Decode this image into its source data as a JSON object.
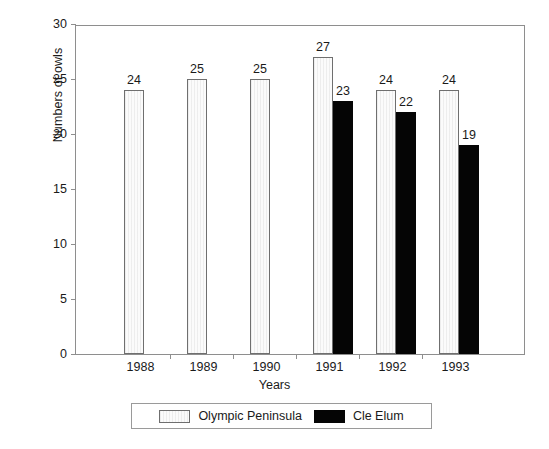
{
  "chart_data": {
    "type": "bar",
    "title": "",
    "xlabel": "Years",
    "ylabel": "Numbers of owls",
    "categories": [
      "1988",
      "1989",
      "1990",
      "1991",
      "1992",
      "1993"
    ],
    "series": [
      {
        "name": "Olympic Peninsula",
        "color": "#fbfbfb",
        "values": [
          24,
          25,
          25,
          27,
          24,
          24
        ]
      },
      {
        "name": "Cle Elum",
        "color": "#050505",
        "values": [
          null,
          null,
          null,
          23,
          22,
          19
        ]
      }
    ],
    "ylim": [
      0,
      30
    ],
    "yticks": [
      0,
      5,
      10,
      15,
      20,
      25,
      30
    ],
    "grid": false,
    "legend_position": "bottom",
    "bar_labels": [
      {
        "category": "1988",
        "series": "Olympic Peninsula",
        "label": "24"
      },
      {
        "category": "1989",
        "series": "Olympic Peninsula",
        "label": "25"
      },
      {
        "category": "1990",
        "series": "Olympic Peninsula",
        "label": "25"
      },
      {
        "category": "1991",
        "series": "Olympic Peninsula",
        "label": "27"
      },
      {
        "category": "1991",
        "series": "Cle Elum",
        "label": "23"
      },
      {
        "category": "1992",
        "series": "Olympic Peninsula",
        "label": "24"
      },
      {
        "category": "1992",
        "series": "Cle Elum",
        "label": "22"
      },
      {
        "category": "1993",
        "series": "Olympic Peninsula",
        "label": "24"
      },
      {
        "category": "1993",
        "series": "Cle Elum",
        "label": "19"
      }
    ]
  },
  "axes": {
    "y": {
      "title": "Numbers of owls",
      "ticks": [
        "0",
        "5",
        "10",
        "15",
        "20",
        "25",
        "30"
      ]
    },
    "x": {
      "title": "Years",
      "ticks": [
        "1988",
        "1989",
        "1990",
        "1991",
        "1992",
        "1993"
      ]
    }
  },
  "legend": {
    "entries": [
      {
        "label": "Olympic Peninsula",
        "swatch": "light"
      },
      {
        "label": "Cle Elum",
        "swatch": "dark"
      }
    ]
  }
}
